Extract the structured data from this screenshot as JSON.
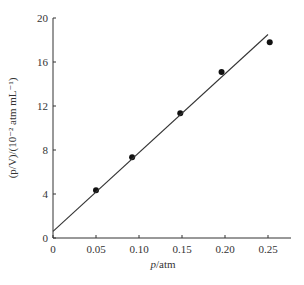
{
  "chart_data": {
    "type": "scatter",
    "title": "",
    "xlabel": "p/atm",
    "ylabel": "(p/V)/(10^-2 atm mL^-1)",
    "xlim": [
      0,
      0.27
    ],
    "ylim": [
      0,
      20
    ],
    "x_ticks": [
      "0",
      "0.05",
      "0.10",
      "0.15",
      "0.20",
      "0.25"
    ],
    "y_ticks": [
      "0",
      "4",
      "8",
      "12",
      "16",
      "20"
    ],
    "grid": false,
    "legend": null,
    "series": [
      {
        "name": "measured",
        "type": "scatter",
        "x": [
          0.05,
          0.092,
          0.148,
          0.196,
          0.252
        ],
        "y": [
          4.35,
          7.35,
          11.35,
          15.1,
          17.8
        ]
      },
      {
        "name": "fit line",
        "type": "line",
        "x": [
          0,
          0.25
        ],
        "y": [
          0.6,
          18.5
        ]
      }
    ]
  },
  "labels": {
    "xlabel_italic": "p",
    "xlabel_unit": "/atm",
    "ylabel_text": "(p/V)/(10⁻² atm mL⁻¹)"
  }
}
